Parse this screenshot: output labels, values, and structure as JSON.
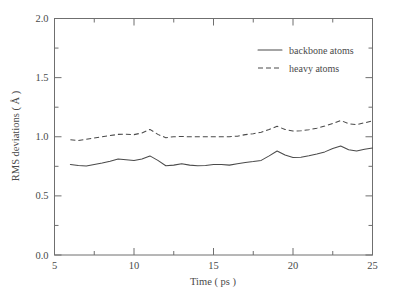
{
  "chart_data": {
    "type": "line",
    "title": "",
    "xlabel": "Time ( ps )",
    "ylabel": "RMS deviations ( Å )",
    "xlim": [
      5,
      25
    ],
    "ylim": [
      0.0,
      2.0
    ],
    "xticks": [
      5,
      10,
      15,
      20,
      25
    ],
    "xtick_labels": [
      "5",
      "10",
      "15",
      "20",
      "25"
    ],
    "xminor_step": 2.5,
    "yticks": [
      0.0,
      0.5,
      1.0,
      1.5,
      2.0
    ],
    "ytick_labels": [
      "0.0",
      "0.5",
      "1.0",
      "1.5",
      "2.0"
    ],
    "yminor_step": 0.25,
    "grid": false,
    "legend_position": "top-right",
    "x": [
      6.0,
      6.5,
      7.0,
      7.5,
      8.0,
      8.5,
      9.0,
      9.5,
      10.0,
      10.5,
      11.0,
      11.5,
      12.0,
      12.5,
      13.0,
      13.5,
      14.0,
      14.5,
      15.0,
      15.5,
      16.0,
      16.5,
      17.0,
      17.5,
      18.0,
      18.5,
      19.0,
      19.5,
      20.0,
      20.5,
      21.0,
      21.5,
      22.0,
      22.5,
      23.0,
      23.5,
      24.0,
      24.5,
      25.0
    ],
    "series": [
      {
        "name": "backbone atoms",
        "style": "solid",
        "color": "#4a4a4a",
        "values": [
          0.765,
          0.757,
          0.752,
          0.765,
          0.778,
          0.793,
          0.812,
          0.806,
          0.8,
          0.812,
          0.838,
          0.8,
          0.755,
          0.76,
          0.772,
          0.76,
          0.755,
          0.757,
          0.765,
          0.765,
          0.76,
          0.772,
          0.782,
          0.79,
          0.8,
          0.838,
          0.88,
          0.845,
          0.825,
          0.827,
          0.84,
          0.855,
          0.872,
          0.9,
          0.922,
          0.89,
          0.88,
          0.895,
          0.905
        ]
      },
      {
        "name": "heavy atoms",
        "style": "dashed",
        "color": "#4a4a4a",
        "values": [
          0.975,
          0.968,
          0.978,
          0.99,
          1.0,
          1.01,
          1.02,
          1.022,
          1.018,
          1.032,
          1.062,
          1.02,
          0.992,
          1.0,
          1.002,
          1.0,
          1.0,
          1.0,
          1.0,
          1.0,
          1.0,
          1.005,
          1.018,
          1.025,
          1.038,
          1.062,
          1.088,
          1.062,
          1.048,
          1.05,
          1.06,
          1.072,
          1.09,
          1.112,
          1.138,
          1.11,
          1.102,
          1.118,
          1.135
        ]
      }
    ]
  },
  "legend": {
    "items": [
      {
        "label": "backbone atoms",
        "style": "solid"
      },
      {
        "label": "heavy atoms",
        "style": "dashed"
      }
    ]
  }
}
